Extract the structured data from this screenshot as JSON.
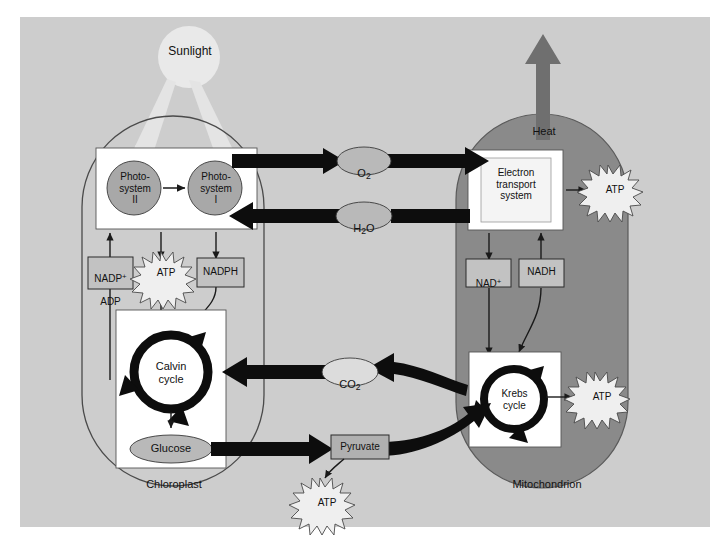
{
  "diagram": {
    "colors": {
      "page_background": "#ffffff",
      "panel_background": "#cdcdcd",
      "mitochondrion_fill": "#8a8a8a",
      "chloroplast_fill": "none",
      "chloroplast_stroke": "#3a3a3a",
      "box_fill": "#c2c2c2",
      "box_stroke": "#2b2b2b",
      "white_panel": "#ffffff",
      "inner_panel": "#f2f2f2",
      "oval_fill": "#b9b9b9",
      "circle_fill": "#a8a8a8",
      "starburst_fill": "#efefef",
      "heat_arrow": "#6f6f6f",
      "sunlight": "#e8e8e8",
      "thick_arrow": "#0d0d0d",
      "thin_arrow": "#1a1a1a"
    }
  },
  "sunlight": {
    "label": "Sunlight"
  },
  "heat": {
    "label": "Heat"
  },
  "chloroplast": {
    "label": "Chloroplast",
    "photosystem_2": "Photo-\nsystem\nII",
    "photosystem_1": "Photo-\nsystem\nI",
    "nadp_adp_line1": "NADP",
    "nadp_adp_sup": "+",
    "nadp_adp_line2": "ADP",
    "atp_label": "ATP",
    "nadph_label": "NADPH",
    "calvin_cycle": "Calvin\ncycle",
    "glucose_label": "Glucose"
  },
  "mitochondrion": {
    "label": "Mitochondrion",
    "electron_transport": "Electron\ntransport\nsystem",
    "atp_ets_label": "ATP",
    "nad_plus_base": "NAD",
    "nad_plus_sup": "+",
    "nadh_label": "NADH",
    "krebs_cycle": "Krebs\ncycle",
    "atp_krebs_label": "ATP"
  },
  "molecules": {
    "oxygen_base": "O",
    "oxygen_sub": "2",
    "water_h": "H",
    "water_sub": "2",
    "water_o": "O",
    "carbon_dioxide_base": "CO",
    "carbon_dioxide_sub": "2",
    "pyruvate": "Pyruvate",
    "atp_glycolysis": "ATP"
  }
}
